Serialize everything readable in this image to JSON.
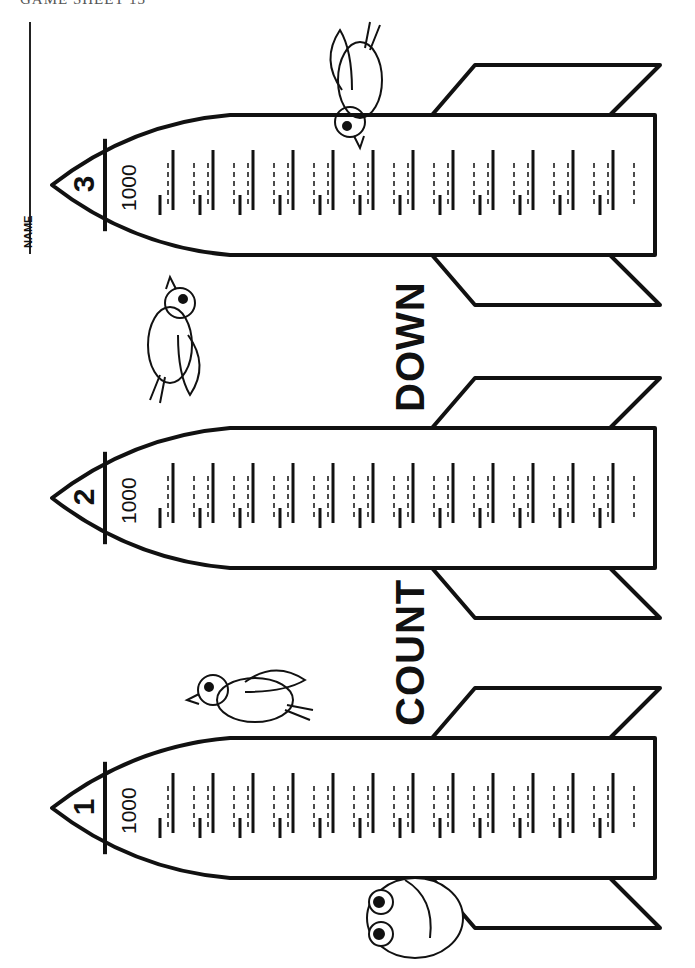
{
  "page": {
    "header": "GAME SHEET 13",
    "name_label": "NAME",
    "title_words": [
      "COUNT",
      "DOWN"
    ]
  },
  "rockets": [
    {
      "number": "1",
      "start_value": "1000",
      "top": 738,
      "bottom": 878
    },
    {
      "number": "2",
      "start_value": "1000",
      "top": 428,
      "bottom": 568
    },
    {
      "number": "3",
      "start_value": "1000",
      "top": 115,
      "bottom": 255
    }
  ],
  "rocket_geometry": {
    "nose_x": 52,
    "nose_cap_x": 105,
    "body_start_x": 230,
    "body_end_x": 655,
    "fin_body_x1": 432,
    "fin_body_x2": 610,
    "fin_tip_x1": 475,
    "fin_tip_x2": 660,
    "fin_reach": 50,
    "answer_slots": 12
  },
  "illustrations": [
    {
      "name": "parrot",
      "on_rocket": 3
    },
    {
      "name": "flying-bird",
      "between": "rocket 2 and 3"
    },
    {
      "name": "woodpecker",
      "on_rocket": 1
    },
    {
      "name": "owl",
      "on_rocket": 1
    }
  ],
  "colors": {
    "ink": "#111111",
    "paper": "#ffffff"
  }
}
